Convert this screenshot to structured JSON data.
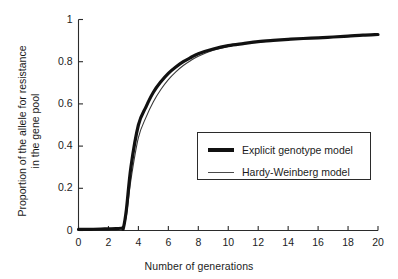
{
  "chart_data": {
    "type": "line",
    "title": "",
    "xlabel": "Number of generations",
    "ylabel_line1": "Proportion of the allele for resistance",
    "ylabel_line2": "in the gene pool",
    "xlim": [
      0,
      20
    ],
    "ylim": [
      0,
      1
    ],
    "xticks": [
      0,
      2,
      4,
      6,
      8,
      10,
      12,
      14,
      16,
      18,
      20
    ],
    "xtick_labels": [
      "0",
      "2",
      "4",
      "6",
      "8",
      "10",
      "12",
      "14",
      "16",
      "18",
      "20"
    ],
    "yticks": [
      0,
      0.2,
      0.4,
      0.6,
      0.8,
      1
    ],
    "ytick_labels": [
      "0",
      "0.2",
      "0.4",
      "0.6",
      "0.8",
      "1"
    ],
    "grid": false,
    "legend_position": "center-right",
    "series": [
      {
        "name": "Explicit genotype model",
        "style": "thick",
        "color": "#111111",
        "linewidth": 3.2,
        "x": [
          0,
          0.5,
          1,
          1.5,
          2,
          2.5,
          2.9,
          3.0,
          3.2,
          3.5,
          4,
          4.5,
          5,
          5.5,
          6,
          6.5,
          7,
          7.5,
          8,
          9,
          10,
          11,
          12,
          13,
          14,
          15,
          16,
          17,
          18,
          19,
          20
        ],
        "y": [
          0.005,
          0.005,
          0.006,
          0.007,
          0.008,
          0.009,
          0.011,
          0.012,
          0.1,
          0.3,
          0.5,
          0.585,
          0.655,
          0.705,
          0.745,
          0.775,
          0.8,
          0.82,
          0.838,
          0.86,
          0.876,
          0.886,
          0.895,
          0.901,
          0.906,
          0.91,
          0.913,
          0.917,
          0.921,
          0.926,
          0.929
        ]
      },
      {
        "name": "Hardy-Weinberg model",
        "style": "thin",
        "color": "#3a3a3a",
        "linewidth": 1.1,
        "x": [
          0,
          0.5,
          1,
          1.5,
          2,
          2.5,
          2.9,
          3.0,
          3.2,
          3.5,
          4,
          4.5,
          5,
          5.5,
          6,
          6.5,
          7,
          7.5,
          8,
          9,
          10,
          11,
          12,
          13,
          14,
          15,
          16,
          17,
          18,
          19,
          20
        ],
        "y": [
          0.004,
          0.004,
          0.005,
          0.006,
          0.007,
          0.008,
          0.01,
          0.011,
          0.07,
          0.24,
          0.44,
          0.535,
          0.61,
          0.668,
          0.715,
          0.752,
          0.782,
          0.806,
          0.826,
          0.854,
          0.872,
          0.884,
          0.893,
          0.9,
          0.905,
          0.909,
          0.912,
          0.916,
          0.92,
          0.925,
          0.928
        ]
      }
    ],
    "legend_entries": [
      {
        "label": "Explicit genotype model",
        "style": "thick"
      },
      {
        "label": "Hardy-Weinberg model",
        "style": "thin"
      }
    ]
  },
  "colors": {
    "background": "#ffffff",
    "axis": "#2b2b2b",
    "text": "#1c1c1c",
    "series_thick": "#111111",
    "series_thin": "#3a3a3a"
  }
}
